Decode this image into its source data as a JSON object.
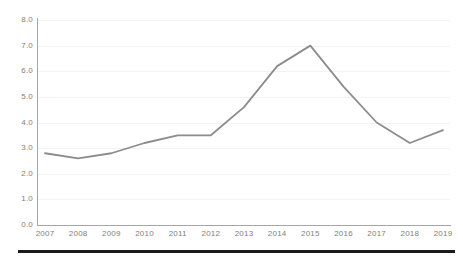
{
  "chart_data": {
    "type": "line",
    "title": "",
    "subtitle": "",
    "xlabel": "",
    "ylabel": "",
    "categories": [
      "2007",
      "2008",
      "2009",
      "2010",
      "2011",
      "2012",
      "2013",
      "2014",
      "2015",
      "2016",
      "2017",
      "2018",
      "2019"
    ],
    "values": [
      2.8,
      2.6,
      2.8,
      3.2,
      3.5,
      3.5,
      4.6,
      6.2,
      7.0,
      5.4,
      4.0,
      3.2,
      3.7
    ],
    "series": [
      {
        "name": "Series 1",
        "values": [
          2.8,
          2.6,
          2.8,
          3.2,
          3.5,
          3.5,
          4.6,
          6.2,
          7.0,
          5.4,
          4.0,
          3.2,
          3.7
        ],
        "color": "#8c8c8c"
      }
    ],
    "xlim": [
      2007,
      2019
    ],
    "ylim": [
      0.0,
      8.0
    ],
    "ytick_labels": [
      "0.0",
      "1.0",
      "2.0",
      "3.0",
      "4.0",
      "5.0",
      "6.0",
      "7.0",
      "8.0"
    ],
    "ytick_values": [
      0.0,
      1.0,
      2.0,
      3.0,
      4.0,
      5.0,
      6.0,
      7.0,
      8.0
    ],
    "xtick_labels": [
      "2007",
      "2008",
      "2009",
      "2010",
      "2011",
      "2012",
      "2013",
      "2014",
      "2015",
      "2016",
      "2017",
      "2018",
      "2019"
    ],
    "grid": true,
    "grid_color": "#f3f3f3",
    "legend": false,
    "legend_position": "none",
    "markers": false,
    "axis_color": "#a6a6a6",
    "tick_label_color": "#808080",
    "background": "#ffffff"
  },
  "footer": {
    "rule_color": "#1a1a1a"
  }
}
